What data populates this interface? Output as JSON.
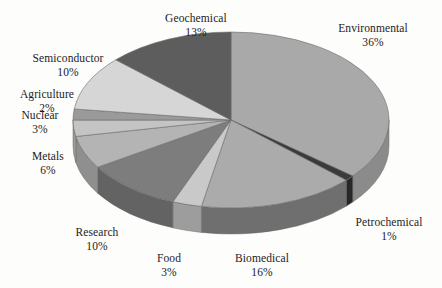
{
  "chart_data": {
    "type": "pie",
    "title": "",
    "subtitle": "",
    "xlabel": "",
    "ylabel": "",
    "legend_position": "none",
    "grid": false,
    "value_unit": "%",
    "total": 100,
    "start_angle_deg": 0,
    "direction": "clockwise",
    "three_d": true,
    "categories": [
      "Environmental",
      "Petrochemical",
      "Biomedical",
      "Food",
      "Research",
      "Metals",
      "Nuclear",
      "Agriculture",
      "Semiconductor",
      "Geochemical"
    ],
    "values": [
      36,
      1,
      16,
      3,
      10,
      6,
      3,
      2,
      10,
      13
    ],
    "labels": [
      "36%",
      "1%",
      "16%",
      "3%",
      "10%",
      "6%",
      "3%",
      "2%",
      "10%",
      "13%"
    ],
    "slices": [
      {
        "name": "Environmental",
        "value": 36,
        "label": "36%",
        "color": "#a9a9a9",
        "side_color": "#8b8b8b"
      },
      {
        "name": "Petrochemical",
        "value": 1,
        "label": "1%",
        "color": "#3a3a3a",
        "side_color": "#272727"
      },
      {
        "name": "Biomedical",
        "value": 16,
        "label": "16%",
        "color": "#ababab",
        "side_color": "#6f6f6f"
      },
      {
        "name": "Food",
        "value": 3,
        "label": "3%",
        "color": "#c9c9c9",
        "side_color": "#9d9d9d"
      },
      {
        "name": "Research",
        "value": 10,
        "label": "10%",
        "color": "#7d7d7d",
        "side_color": "#636363"
      },
      {
        "name": "Metals",
        "value": 6,
        "label": "6%",
        "color": "#b4b4b4",
        "side_color": "#8f8f8f"
      },
      {
        "name": "Nuclear",
        "value": 3,
        "label": "3%",
        "color": "#c4c4c4",
        "side_color": "#9a9a9a"
      },
      {
        "name": "Agriculture",
        "value": 2,
        "label": "2%",
        "color": "#9a9a9a",
        "side_color": "#7c7c7c"
      },
      {
        "name": "Semiconductor",
        "value": 10,
        "label": "10%",
        "color": "#d6d6d6",
        "side_color": "#a8a8a8"
      },
      {
        "name": "Geochemical",
        "value": 13,
        "label": "13%",
        "color": "#5d5d5d",
        "side_color": "#4a4a4a"
      }
    ],
    "label_positions": [
      {
        "name": "Environmental",
        "x": 373,
        "y": 22,
        "align": "center"
      },
      {
        "name": "Petrochemical",
        "x": 389,
        "y": 216,
        "align": "center"
      },
      {
        "name": "Biomedical",
        "x": 262,
        "y": 252,
        "align": "center"
      },
      {
        "name": "Food",
        "x": 169,
        "y": 252,
        "align": "center"
      },
      {
        "name": "Research",
        "x": 97,
        "y": 226,
        "align": "center"
      },
      {
        "name": "Metals",
        "x": 48,
        "y": 150,
        "align": "center"
      },
      {
        "name": "Nuclear",
        "x": 40,
        "y": 109,
        "align": "center"
      },
      {
        "name": "Agriculture",
        "x": 47,
        "y": 88,
        "align": "center"
      },
      {
        "name": "Semiconductor",
        "x": 68,
        "y": 52,
        "align": "center"
      },
      {
        "name": "Geochemical",
        "x": 196,
        "y": 12,
        "align": "center"
      }
    ],
    "geometry": {
      "center_x": 231,
      "center_y": 120,
      "radius_x": 158,
      "radius_y": 88,
      "depth": 26
    },
    "background_color": "#fdfdfc",
    "text_color": "#1c1c1c",
    "edge_color": "#6b6b6b"
  }
}
